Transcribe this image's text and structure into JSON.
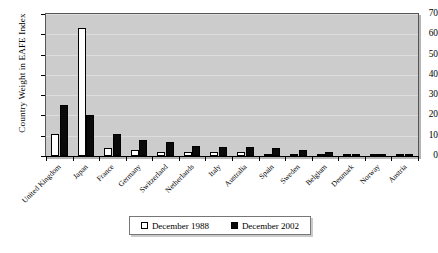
{
  "chart_data": {
    "type": "bar",
    "title": "",
    "xlabel": "",
    "ylabel": "Country Weight in EAFE Index",
    "ylim": [
      0,
      70
    ],
    "yticks": [
      0,
      10,
      20,
      30,
      40,
      50,
      60,
      70
    ],
    "grid": true,
    "legend_position": "bottom",
    "categories": [
      "United Kingdom",
      "Japan",
      "France",
      "Germany",
      "Switzerland",
      "Netherlands",
      "Italy",
      "Australia",
      "Spain",
      "Sweden",
      "Belgium",
      "Denmark",
      "Norway",
      "Austria"
    ],
    "series": [
      {
        "name": "December 1988",
        "color": "#ffffff",
        "values": [
          11,
          63,
          4,
          3,
          2,
          2,
          2,
          2,
          1,
          1,
          1,
          0.6,
          0.5,
          0.4
        ]
      },
      {
        "name": "December 2002",
        "color": "#0a0a0a",
        "values": [
          25,
          20,
          11,
          8,
          7,
          5,
          4.5,
          4.5,
          4,
          3,
          2,
          1,
          0.8,
          0.6
        ]
      }
    ]
  },
  "legend": {
    "entries": [
      {
        "label": "December 1988",
        "swatch": "white"
      },
      {
        "label": "December 2002",
        "swatch": "black"
      }
    ]
  }
}
